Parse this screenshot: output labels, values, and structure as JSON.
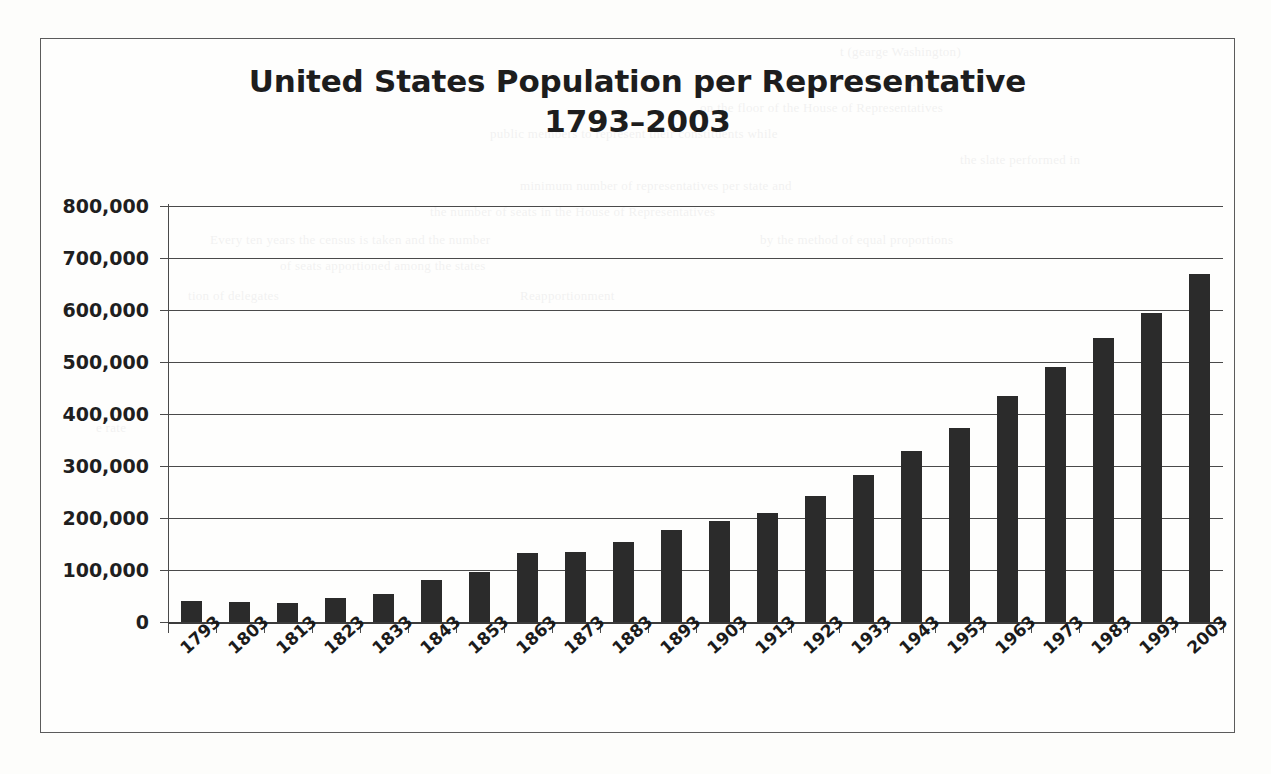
{
  "page": {
    "background_color": "#fdfdfb",
    "frame_color": "#5b5b5b"
  },
  "chart_data": {
    "type": "bar",
    "title": "United States Population per Representative 1793–2003",
    "title_line1": "United States Population per Representative",
    "title_line2": "1793–2003",
    "xlabel": "",
    "ylabel": "",
    "ylim": [
      0,
      800000
    ],
    "ytick_step": 100000,
    "grid": true,
    "legend": false,
    "bar_color": "#2b2b2b",
    "categories": [
      "1793",
      "1803",
      "1813",
      "1823",
      "1833",
      "1843",
      "1853",
      "1863",
      "1873",
      "1883",
      "1893",
      "1903",
      "1913",
      "1923",
      "1933",
      "1943",
      "1953",
      "1963",
      "1973",
      "1983",
      "1993",
      "2003"
    ],
    "values": [
      40000,
      39000,
      37000,
      46000,
      54000,
      80000,
      96000,
      132000,
      135000,
      153000,
      176000,
      195000,
      210000,
      243000,
      283000,
      328000,
      374000,
      435000,
      491000,
      546000,
      594000,
      669000
    ],
    "ytick_labels": [
      "800,000",
      "700,000",
      "600,000",
      "500,000",
      "400,000",
      "300,000",
      "200,000",
      "100,000",
      "0"
    ],
    "ytick_values": [
      800000,
      700000,
      600000,
      500000,
      400000,
      300000,
      200000,
      100000,
      0
    ]
  },
  "background_text": [
    "t (gearge Washington)",
    "the",
    "on the floor of the House of Representatives",
    "public members to represent their constituents while",
    "the slate performed in",
    "minimum number of representatives per state and",
    "the number of seats in the House of Representatives",
    "Reapportionment",
    "tion of delegates",
    "Every ten years the census is taken and the number",
    "of seats apportioned among the states",
    "by the method of equal proportions",
    "e rate"
  ]
}
